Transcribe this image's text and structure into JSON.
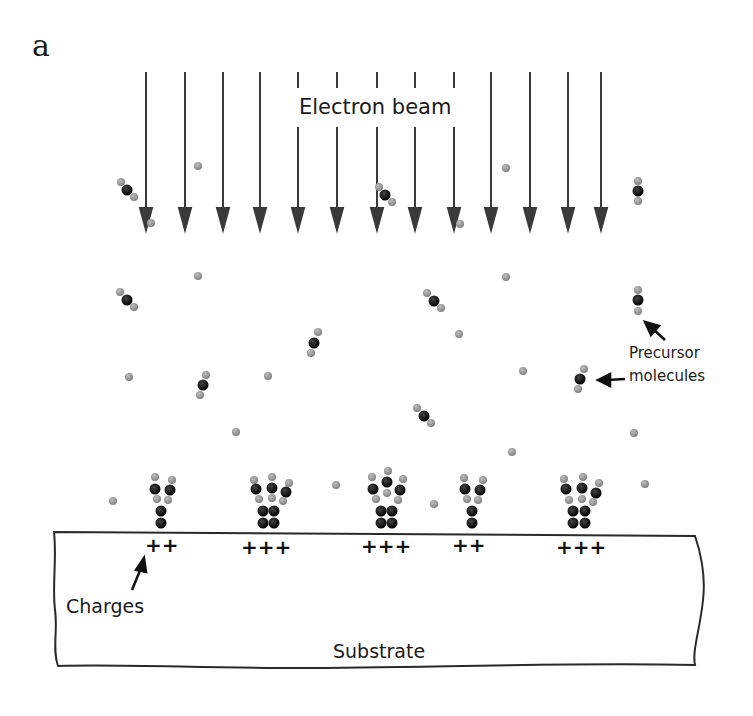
{
  "figure": {
    "panel_label": "a",
    "labels": {
      "electron_beam": "Electron beam",
      "precursor_line1": "Precursor",
      "precursor_line2": "molecules",
      "charges": "Charges",
      "substrate": "Substrate"
    },
    "colors": {
      "arrow": "#3a3a3a",
      "atom_dark": "#111111",
      "atom_light": "#9a9a9a",
      "line": "#2a2a2a"
    },
    "beam_arrows_x": [
      146,
      185,
      223,
      260,
      298,
      336,
      375,
      414,
      453,
      491,
      530,
      568,
      600
    ],
    "deposits": [
      {
        "x": 160,
        "charges": "++",
        "columns": 1
      },
      {
        "x": 268,
        "charges": "+++",
        "columns": 2
      },
      {
        "x": 385,
        "charges": "+++",
        "columns": 2
      },
      {
        "x": 468,
        "charges": "++",
        "columns": 1
      },
      {
        "x": 578,
        "charges": "+++",
        "columns": 2
      }
    ]
  }
}
